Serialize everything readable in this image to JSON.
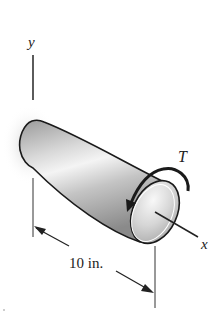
{
  "figure": {
    "type": "mechanics-torsion-diagram",
    "labels": {
      "y_axis": "y",
      "x_axis": "x",
      "torque": "T",
      "length_dimension": "10 in."
    },
    "elements": [
      "tapered cylindrical shaft",
      "y axis",
      "x axis",
      "torque arrow T",
      "length dimension line"
    ],
    "colors": {
      "outline": "#1a1a1a",
      "shaft_light": "#f2f2f2",
      "shaft_mid": "#bdbdbd",
      "shaft_dark": "#8c8c8c",
      "background": "#ffffff"
    }
  }
}
